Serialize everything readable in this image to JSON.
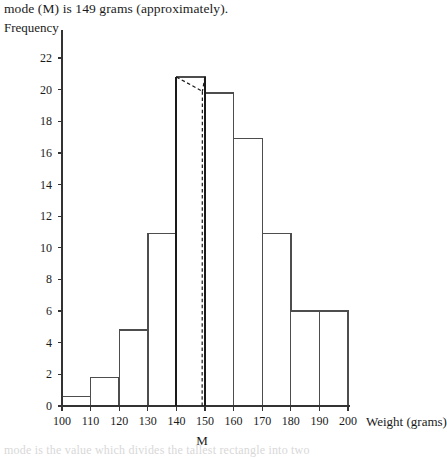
{
  "caption": {
    "text": "mode (M) is 149 grams (approximately)."
  },
  "footer": {
    "text": "mode is the value which divides the tallest rectangle into two"
  },
  "chart_data": {
    "type": "bar",
    "title": "",
    "subtitle": "",
    "xlabel": "Weight (grams)",
    "ylabel": "Frequency",
    "bin_edges": [
      100,
      110,
      120,
      130,
      140,
      150,
      160,
      170,
      180,
      190,
      200
    ],
    "categories": [
      "100-110",
      "110-120",
      "120-130",
      "130-140",
      "140-150",
      "150-160",
      "160-170",
      "170-180",
      "180-190",
      "190-200"
    ],
    "values": [
      0.6,
      1.8,
      4.8,
      10.9,
      20.8,
      19.8,
      16.9,
      10.9,
      6,
      6
    ],
    "xlim": [
      100,
      200
    ],
    "ylim": [
      0,
      22
    ],
    "ytick_labels": [
      "0",
      "2",
      "4",
      "6",
      "8",
      "10",
      "12",
      "14",
      "16",
      "18",
      "20",
      "22"
    ],
    "ytick_values": [
      0,
      2,
      4,
      6,
      8,
      10,
      12,
      14,
      16,
      18,
      20,
      22
    ],
    "xtick_labels": [
      "100",
      "110",
      "120",
      "130",
      "140",
      "150",
      "160",
      "170",
      "180",
      "190",
      "200"
    ],
    "xtick_values": [
      100,
      110,
      120,
      130,
      140,
      150,
      160,
      170,
      180,
      190,
      200
    ],
    "grid": false,
    "legend": null,
    "annotations": [
      {
        "name": "mode-marker",
        "label": "M",
        "x": 149,
        "description": "mode value marked on the weight axis below the tallest rectangle"
      },
      {
        "name": "mode-construction-lines",
        "style": "dashed",
        "description": "two dashed cross lines drawn inside the tallest rectangle (140-150) from its top corners to the tops of the adjacent rectangles, intersecting at the mode, with a vertical dashed drop line to the axis at 149"
      }
    ],
    "colors": {
      "bar_stroke": "#4d4d4d",
      "bar_fill": "#ffffff",
      "axis": "#333333",
      "construction_line": "#1a1a1a"
    }
  },
  "axis_titles": {
    "y": "Frequency",
    "x": "Weight (grams)"
  }
}
